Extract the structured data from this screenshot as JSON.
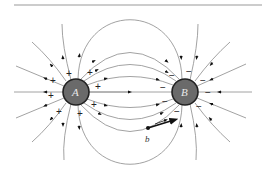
{
  "figure": {
    "top_rule": true,
    "charges": [
      {
        "id": "A",
        "label": "A",
        "sign": "+",
        "x": 76,
        "y": 92,
        "r": 13
      },
      {
        "id": "B",
        "label": "B",
        "sign": "-",
        "x": 185,
        "y": 92,
        "r": 13
      }
    ],
    "point": {
      "label": "b",
      "x": 148,
      "y": 128
    },
    "colors": {
      "charge_fill": "#6a6a6a",
      "charge_stroke": "#222222",
      "field_line": "#8a8a8a",
      "arrow": "#111111"
    },
    "plus_sign": "+",
    "minus_sign": "−"
  }
}
